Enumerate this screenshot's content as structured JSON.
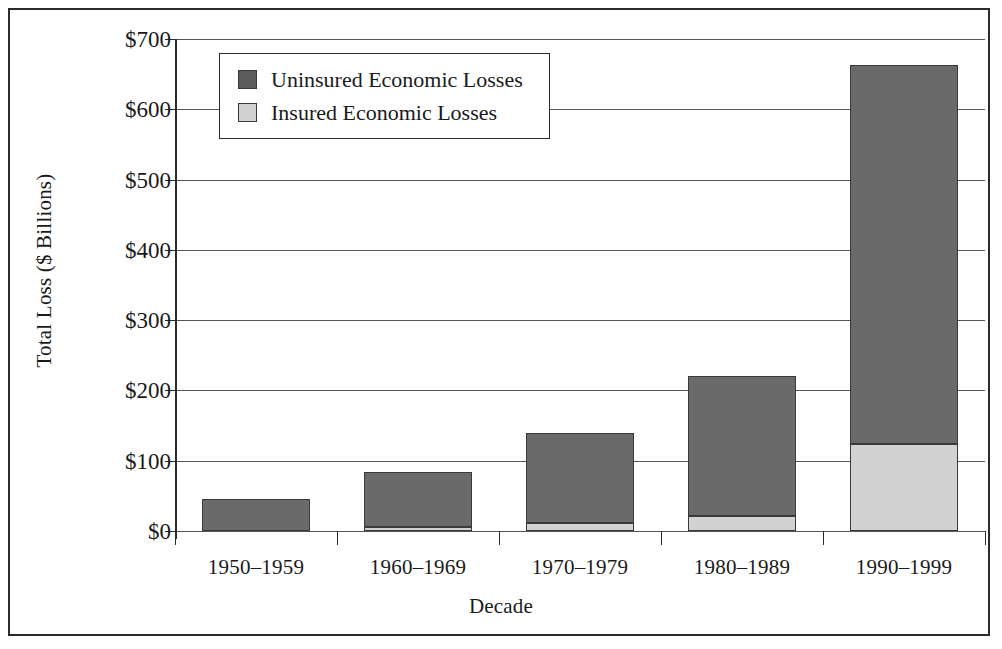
{
  "chart_data": {
    "type": "bar",
    "subtype": "stacked-bar",
    "title": "",
    "xlabel": "Decade",
    "ylabel": "Total Loss ($ Billions)",
    "categories": [
      "1950–1959",
      "1960–1969",
      "1970–1979",
      "1980–1989",
      "1990–1999"
    ],
    "series": [
      {
        "name": "Insured Economic Losses",
        "color": "#d2d2d2",
        "values": [
          0,
          5,
          12,
          21,
          124
        ]
      },
      {
        "name": "Uninsured Economic Losses",
        "color": "#6a6a6a",
        "values": [
          45,
          79,
          128,
          199,
          539
        ]
      }
    ],
    "totals": [
      45,
      84,
      140,
      220,
      663
    ],
    "stack_order": [
      "Insured Economic Losses",
      "Uninsured Economic Losses"
    ],
    "ylim": [
      0,
      700
    ],
    "ytick_values": [
      0,
      100,
      200,
      300,
      400,
      500,
      600,
      700
    ],
    "ytick_labels": [
      "$0",
      "$100",
      "$200",
      "$300",
      "$400",
      "$500",
      "$600",
      "$700"
    ],
    "grid": "horizontal",
    "legend_position": "top-left-inside"
  },
  "legend": {
    "entries": [
      {
        "label": "Uninsured Economic Losses",
        "swatch": "dark-gray-swatch"
      },
      {
        "label": "Insured Economic Losses",
        "swatch": "light-gray-swatch"
      }
    ]
  },
  "colors": {
    "uninsured": "#6a6a6a",
    "insured": "#d2d2d2",
    "axis": "#2b2b2b",
    "gridline": "#555555",
    "background": "#ffffff"
  }
}
